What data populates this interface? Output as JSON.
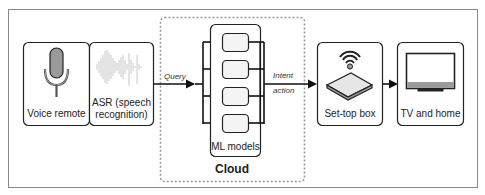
{
  "diagram": {
    "type": "flow",
    "nodes": {
      "voice_remote": {
        "label": "Voice remote",
        "icon": "microphone-icon"
      },
      "asr": {
        "label_line1": "ASR (speech",
        "label_line2": "recognition)",
        "icon": "waveform-icon"
      },
      "ml_models": {
        "label": "ML models",
        "count": 4
      },
      "cloud": {
        "label": "Cloud"
      },
      "set_top_box": {
        "label": "Set-top box",
        "icon": "set-top-box-wifi-icon"
      },
      "tv_home": {
        "label": "TV and home",
        "icon": "tv-icon"
      }
    },
    "edges": {
      "query": {
        "label": "Query"
      },
      "intent": {
        "label_line1": "Intent",
        "label_line2": "action"
      }
    },
    "colors": {
      "stroke": "#222222",
      "box_fill": "#ffffff",
      "inner_fill": "#f4f4f4",
      "mic_fill": "#9a9a9a",
      "waveform": "#c8c8c8",
      "dashed": "#9a9a9a",
      "frame": "#8a8a8a"
    }
  }
}
